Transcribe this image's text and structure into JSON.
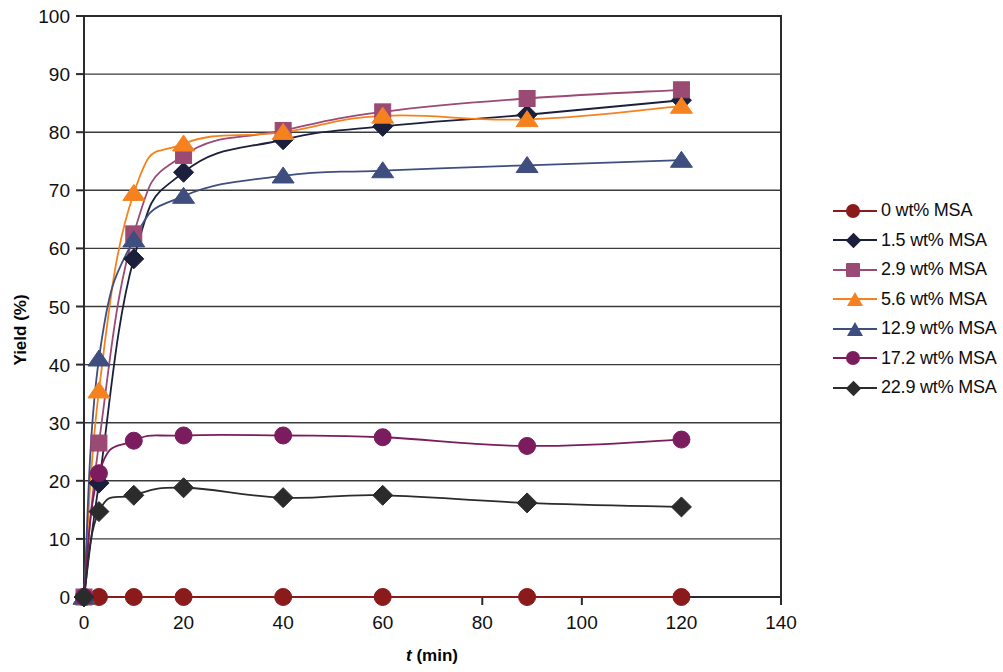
{
  "chart_data": {
    "type": "line",
    "title": "",
    "xlabel": "t (min)",
    "xlabel_italic_part": "t",
    "xlabel_rest": " (min)",
    "ylabel": "Yield (%)",
    "xlim": [
      0,
      140
    ],
    "ylim": [
      0,
      100
    ],
    "xticks": [
      "0",
      "20",
      "40",
      "60",
      "80",
      "100",
      "120",
      "140"
    ],
    "xtick_values": [
      0,
      20,
      40,
      60,
      80,
      100,
      120,
      140
    ],
    "yticks": [
      "0",
      "10",
      "20",
      "30",
      "40",
      "50",
      "60",
      "70",
      "80",
      "90",
      "100"
    ],
    "ytick_values": [
      0,
      10,
      20,
      30,
      40,
      50,
      60,
      70,
      80,
      90,
      100
    ],
    "grid": "horizontal",
    "legend_position": "right",
    "x": [
      0,
      3,
      10,
      20,
      40,
      60,
      89,
      120
    ],
    "series": [
      {
        "name": "0 wt% MSA",
        "color": "#8B1A1A",
        "marker": "circle",
        "values": [
          0,
          0,
          0,
          0,
          0,
          0,
          0,
          0
        ]
      },
      {
        "name": "1.5 wt% MSA",
        "color": "#1B1F3B",
        "marker": "diamond",
        "values": [
          0,
          19.6,
          58.2,
          73.1,
          78.7,
          81.0,
          83.0,
          85.5
        ]
      },
      {
        "name": "2.9 wt% MSA",
        "color": "#9B4A74",
        "marker": "square",
        "values": [
          0,
          26.5,
          62.5,
          76.0,
          80.3,
          83.5,
          85.8,
          87.3
        ]
      },
      {
        "name": "5.6 wt% MSA",
        "color": "#F5821F",
        "marker": "triangle",
        "values": [
          0,
          35.5,
          69.5,
          78.0,
          80.0,
          82.8,
          82.2,
          84.5
        ]
      },
      {
        "name": "12.9 wt% MSA",
        "color": "#3E4E7E",
        "marker": "triangle",
        "values": [
          0,
          41.0,
          61.5,
          69.0,
          72.5,
          73.4,
          74.3,
          75.2
        ]
      },
      {
        "name": "17.2 wt% MSA",
        "color": "#7B1C5E",
        "marker": "circle",
        "values": [
          0,
          21.3,
          26.9,
          27.8,
          27.8,
          27.5,
          26.0,
          27.1
        ]
      },
      {
        "name": "22.9 wt% MSA",
        "color": "#2B2B2B",
        "marker": "diamond",
        "values": [
          0,
          14.7,
          17.5,
          18.8,
          17.1,
          17.5,
          16.2,
          15.5
        ]
      }
    ]
  },
  "legend": {
    "items": [
      {
        "label": "0 wt% MSA"
      },
      {
        "label": "1.5 wt% MSA"
      },
      {
        "label": "2.9 wt% MSA"
      },
      {
        "label": "5.6 wt% MSA"
      },
      {
        "label": "12.9 wt% MSA"
      },
      {
        "label": "17.2 wt% MSA"
      },
      {
        "label": "22.9 wt% MSA"
      }
    ]
  }
}
